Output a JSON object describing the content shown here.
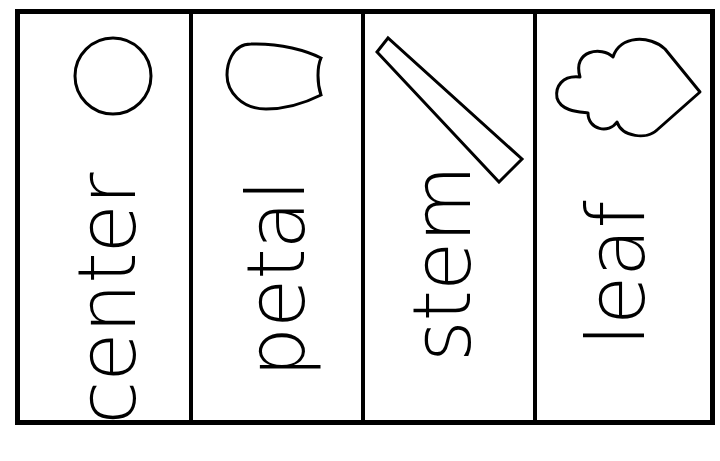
{
  "worksheet": {
    "panels": [
      {
        "label": "center",
        "icon": "circle-icon"
      },
      {
        "label": "petal",
        "icon": "petal-icon"
      },
      {
        "label": "stem",
        "icon": "stem-icon"
      },
      {
        "label": "leaf",
        "icon": "leaf-icon"
      }
    ]
  },
  "colors": {
    "stroke": "#000000",
    "background": "#ffffff"
  }
}
